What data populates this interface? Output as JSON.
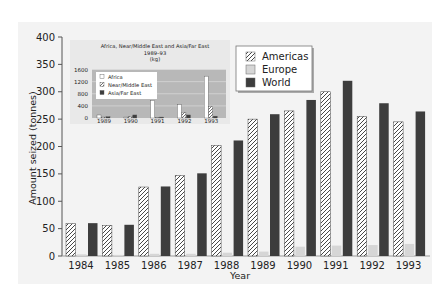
{
  "chart_data": [
    {
      "id": "main",
      "type": "bar",
      "title": "",
      "xlabel": "Year",
      "ylabel": "Amount seized (tonnes)",
      "ylim": [
        0,
        400
      ],
      "yticks": [
        0,
        50,
        100,
        150,
        200,
        250,
        300,
        350,
        400
      ],
      "grid": false,
      "legend_position": "upper-center",
      "categories": [
        "1984",
        "1985",
        "1986",
        "1987",
        "1988",
        "1989",
        "1990",
        "1991",
        "1992",
        "1993"
      ],
      "series": [
        {
          "name": "Americas",
          "pattern": "hatched",
          "values": [
            59,
            56,
            126,
            147,
            202,
            250,
            265,
            300,
            255,
            245
          ]
        },
        {
          "name": "Europe",
          "pattern": "light-grey",
          "values": [
            3,
            2,
            4,
            4,
            6,
            8,
            17,
            19,
            20,
            22
          ]
        },
        {
          "name": "World",
          "pattern": "dark-grey",
          "values": [
            60,
            57,
            127,
            151,
            211,
            259,
            285,
            320,
            279,
            264
          ]
        }
      ]
    },
    {
      "id": "inset",
      "type": "bar",
      "title": "Africa, Near/Middle East and Asia/Far East 1989–93 (kg)",
      "title_lines": [
        "Africa, Near/Middle East and Asia/Far East",
        "1989–93",
        "(kg)"
      ],
      "xlabel": "",
      "ylabel": "",
      "ylim": [
        0,
        1600
      ],
      "yticks": [
        0,
        400,
        800,
        1200,
        1600
      ],
      "grid": true,
      "legend_position": "upper-left",
      "categories": [
        "1989",
        "1990",
        "1991",
        "1992",
        "1993"
      ],
      "series": [
        {
          "name": "Africa",
          "pattern": "white",
          "values": [
            100,
            30,
            580,
            440,
            1380
          ]
        },
        {
          "name": "Near/Middle East",
          "pattern": "hatched",
          "values": [
            30,
            50,
            10,
            190,
            380
          ]
        },
        {
          "name": "Asia/Far East",
          "pattern": "dark-grey",
          "values": [
            40,
            100,
            30,
            100,
            60
          ]
        }
      ]
    }
  ],
  "colors": {
    "panel_bg": "#f3f3f3",
    "inset_plot_bg": "#b8b8b8",
    "europe": "#d6d6d6",
    "world": "#3d3d3d",
    "hatch_line": "#333333",
    "axis": "#555555"
  }
}
